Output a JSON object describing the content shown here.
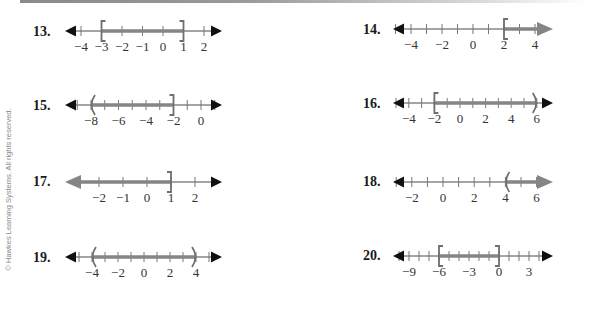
{
  "copyright": "© Hawkes Learning Systems. All rights reserved.",
  "colors": {
    "axis": "#4a4a4a",
    "shade": "#858585",
    "text": "#333333"
  },
  "problems": [
    {
      "number": "13.",
      "nx": 33,
      "ny": 24,
      "x0": 65,
      "x1": 222,
      "y": 31,
      "zero": 163,
      "unit": 20.5,
      "ticks": [
        -4,
        -3,
        -2,
        -1,
        0,
        1,
        2
      ],
      "labels": [
        -4,
        -3,
        -2,
        -1,
        0,
        1,
        2
      ],
      "labelText": [
        "−4",
        "−3",
        "−2",
        "−1",
        "0",
        "1",
        "2"
      ],
      "interval": {
        "from": -3,
        "to": 1,
        "left": "[",
        "right": "]"
      }
    },
    {
      "number": "14.",
      "nx": 363,
      "ny": 22,
      "x0": 393,
      "x1": 553,
      "y": 29,
      "zero": 473,
      "unit": 15.5,
      "ticks": [
        -5,
        -4,
        -3,
        -2,
        -1,
        0,
        1,
        2,
        3,
        4
      ],
      "labels": [
        -4,
        -2,
        0,
        2,
        4
      ],
      "labelText": [
        "−4",
        "−2",
        "0",
        "2",
        "4"
      ],
      "interval": {
        "from": 2,
        "to": "inf",
        "left": "[",
        "right": "arrow"
      }
    },
    {
      "number": "15.",
      "nx": 33,
      "ny": 98,
      "x0": 65,
      "x1": 222,
      "y": 105,
      "zero": 201,
      "unit": 13.75,
      "ticks": [
        -9,
        -8,
        -7,
        -6,
        -5,
        -4,
        -3,
        -2,
        -1,
        0,
        1
      ],
      "labels": [
        -8,
        -6,
        -4,
        -2,
        0
      ],
      "labelText": [
        "−8",
        "−6",
        "−4",
        "−2",
        "0"
      ],
      "interval": {
        "from": -8,
        "to": -2,
        "left": "(",
        "right": "]"
      }
    },
    {
      "number": "16.",
      "nx": 363,
      "ny": 96,
      "x0": 393,
      "x1": 553,
      "y": 103,
      "zero": 460,
      "unit": 12.8,
      "ticks": [
        -5,
        -4,
        -3,
        -2,
        -1,
        0,
        1,
        2,
        3,
        4,
        5,
        6
      ],
      "labels": [
        -4,
        -2,
        0,
        2,
        4,
        6
      ],
      "labelText": [
        "−4",
        "−2",
        "0",
        "2",
        "4",
        "6"
      ],
      "interval": {
        "from": -2,
        "to": 6,
        "left": "[",
        "right": ")"
      }
    },
    {
      "number": "17.",
      "nx": 33,
      "ny": 174,
      "x0": 65,
      "x1": 222,
      "y": 182,
      "zero": 147,
      "unit": 24,
      "ticks": [
        -2,
        -1,
        0,
        1,
        2
      ],
      "labels": [
        -2,
        -1,
        0,
        1,
        2
      ],
      "labelText": [
        "−2",
        "−1",
        "0",
        "1",
        "2"
      ],
      "interval": {
        "from": "-inf",
        "to": 1,
        "left": "arrow",
        "right": "]"
      }
    },
    {
      "number": "18.",
      "nx": 363,
      "ny": 174,
      "x0": 393,
      "x1": 553,
      "y": 182,
      "zero": 443,
      "unit": 15.6,
      "ticks": [
        -3,
        -2,
        -1,
        0,
        1,
        2,
        3,
        4,
        5,
        6
      ],
      "labels": [
        -2,
        0,
        2,
        4,
        6
      ],
      "labelText": [
        "−2",
        "0",
        "2",
        "4",
        "6"
      ],
      "interval": {
        "from": 4,
        "to": "inf",
        "left": "(",
        "right": "arrow"
      }
    },
    {
      "number": "19.",
      "nx": 33,
      "ny": 250,
      "x0": 65,
      "x1": 222,
      "y": 257,
      "zero": 144,
      "unit": 13,
      "ticks": [
        -5,
        -4,
        -3,
        -2,
        -1,
        0,
        1,
        2,
        3,
        4,
        5
      ],
      "labels": [
        -4,
        -2,
        0,
        2,
        4
      ],
      "labelText": [
        "−4",
        "−2",
        "0",
        "2",
        "4"
      ],
      "interval": {
        "from": -4,
        "to": 4,
        "left": "(",
        "right": ")"
      }
    },
    {
      "number": "20.",
      "nx": 363,
      "ny": 248,
      "x0": 393,
      "x1": 553,
      "y": 256,
      "zero": 499,
      "unit": 10,
      "ticks": [
        -10,
        -9,
        -8,
        -7,
        -6,
        -5,
        -4,
        -3,
        -2,
        -1,
        0,
        1,
        2,
        3,
        4
      ],
      "labels": [
        -9,
        -6,
        -3,
        0,
        3
      ],
      "labelText": [
        "−9",
        "−6",
        "−3",
        "0",
        "3"
      ],
      "interval": {
        "from": -6,
        "to": 0,
        "left": "[",
        "right": "]"
      }
    }
  ]
}
